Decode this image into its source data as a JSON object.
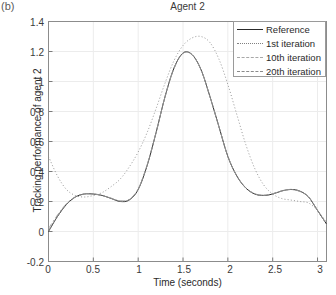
{
  "panel_tag": "(b)",
  "axis": {
    "x_label": "Time (seconds)",
    "y_label": "Tracking performance of agent 2",
    "x_ticks": [
      "0",
      "0.5",
      "1",
      "1.5",
      "2",
      "2.5",
      "3"
    ],
    "y_ticks": [
      "1.4",
      "1.2",
      "1",
      "0.8",
      "0.6",
      "0.4",
      "0.2",
      "0",
      "-0.2"
    ]
  },
  "legend": {
    "entries": [
      {
        "label": "Reference",
        "style": "solid"
      },
      {
        "label": "1st iteration",
        "style": "dotted"
      },
      {
        "label": "10th iteration",
        "style": "dashdot"
      },
      {
        "label": "20th iteration",
        "style": "dashed"
      }
    ]
  },
  "chart_data": {
    "type": "line",
    "title": "Agent 2",
    "xlabel": "Time (seconds)",
    "ylabel": "Tracking performance of agent 2",
    "xlim": [
      0,
      3.1
    ],
    "ylim": [
      -0.2,
      1.4
    ],
    "xticks": [
      0,
      0.5,
      1,
      1.5,
      2,
      2.5,
      3
    ],
    "yticks": [
      -0.2,
      0,
      0.2,
      0.4,
      0.6,
      0.8,
      1,
      1.2,
      1.4
    ],
    "grid": true,
    "legend_position": "top-right",
    "series": [
      {
        "name": "Reference",
        "style": "solid",
        "color": "#2a2a2a",
        "x": [
          0,
          0.1,
          0.2,
          0.3,
          0.4,
          0.5,
          0.6,
          0.7,
          0.8,
          0.9,
          1.0,
          1.1,
          1.2,
          1.3,
          1.4,
          1.5,
          1.6,
          1.7,
          1.8,
          1.9,
          2.0,
          2.1,
          2.2,
          2.3,
          2.4,
          2.5,
          2.6,
          2.7,
          2.8,
          2.9,
          3.0,
          3.1
        ],
        "y": [
          0.0,
          0.1,
          0.18,
          0.23,
          0.25,
          0.25,
          0.24,
          0.22,
          0.2,
          0.21,
          0.28,
          0.44,
          0.66,
          0.9,
          1.09,
          1.19,
          1.18,
          1.08,
          0.9,
          0.7,
          0.5,
          0.37,
          0.29,
          0.25,
          0.24,
          0.25,
          0.27,
          0.28,
          0.27,
          0.23,
          0.14,
          0.05
        ]
      },
      {
        "name": "1st iteration",
        "style": "dotted",
        "color": "#8a8a8a",
        "x": [
          0,
          0.1,
          0.2,
          0.3,
          0.4,
          0.5,
          0.6,
          0.7,
          0.8,
          0.9,
          1.0,
          1.1,
          1.2,
          1.3,
          1.4,
          1.5,
          1.6,
          1.7,
          1.8,
          1.9,
          2.0,
          2.1,
          2.2,
          2.3,
          2.4,
          2.5,
          2.6,
          2.7,
          2.8,
          2.9,
          3.0,
          3.1
        ],
        "y": [
          0.5,
          0.37,
          0.28,
          0.24,
          0.23,
          0.24,
          0.26,
          0.3,
          0.35,
          0.43,
          0.53,
          0.66,
          0.82,
          0.99,
          1.14,
          1.24,
          1.29,
          1.3,
          1.26,
          1.15,
          0.98,
          0.78,
          0.58,
          0.42,
          0.31,
          0.25,
          0.22,
          0.21,
          0.2,
          0.19,
          0.14,
          0.06
        ]
      },
      {
        "name": "10th iteration",
        "style": "dashdot",
        "color": "#a0a0a0",
        "x": [
          0,
          0.1,
          0.2,
          0.3,
          0.4,
          0.5,
          0.6,
          0.7,
          0.8,
          0.9,
          1.0,
          1.1,
          1.2,
          1.3,
          1.4,
          1.5,
          1.6,
          1.7,
          1.8,
          1.9,
          2.0,
          2.1,
          2.2,
          2.3,
          2.4,
          2.5,
          2.6,
          2.7,
          2.8,
          2.9,
          3.0,
          3.1
        ],
        "y": [
          0.02,
          0.11,
          0.185,
          0.232,
          0.25,
          0.25,
          0.24,
          0.222,
          0.205,
          0.215,
          0.285,
          0.445,
          0.662,
          0.9,
          1.088,
          1.188,
          1.178,
          1.078,
          0.9,
          0.7,
          0.502,
          0.372,
          0.292,
          0.252,
          0.242,
          0.252,
          0.27,
          0.28,
          0.268,
          0.23,
          0.142,
          0.052
        ]
      },
      {
        "name": "20th iteration",
        "style": "dashed",
        "color": "#8e8e8e",
        "x": [
          0,
          0.1,
          0.2,
          0.3,
          0.4,
          0.5,
          0.6,
          0.7,
          0.8,
          0.9,
          1.0,
          1.1,
          1.2,
          1.3,
          1.4,
          1.5,
          1.6,
          1.7,
          1.8,
          1.9,
          2.0,
          2.1,
          2.2,
          2.3,
          2.4,
          2.5,
          2.6,
          2.7,
          2.8,
          2.9,
          3.0,
          3.1
        ],
        "y": [
          0.005,
          0.102,
          0.182,
          0.23,
          0.25,
          0.25,
          0.24,
          0.221,
          0.202,
          0.212,
          0.282,
          0.442,
          0.661,
          0.9,
          1.089,
          1.189,
          1.179,
          1.079,
          0.9,
          0.7,
          0.501,
          0.371,
          0.291,
          0.251,
          0.241,
          0.251,
          0.271,
          0.281,
          0.269,
          0.231,
          0.141,
          0.051
        ]
      }
    ],
    "annotations": [
      "(b)"
    ]
  }
}
